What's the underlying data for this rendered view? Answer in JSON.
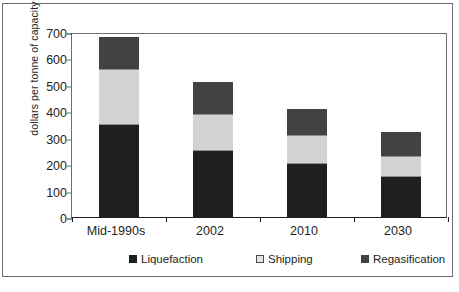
{
  "chart_data": {
    "type": "bar",
    "stacked": true,
    "title": "",
    "subtitle": "",
    "xlabel": "",
    "ylabel": "dollars per tonne of capacity",
    "categories": [
      "Mid-1990s",
      "2002",
      "2010",
      "2030"
    ],
    "series": [
      {
        "name": "Liquefaction",
        "color": "#1f1f1f",
        "values": [
          350,
          250,
          200,
          150
        ]
      },
      {
        "name": "Shipping",
        "color": "#d3d3d3",
        "values": [
          210,
          140,
          110,
          80
        ]
      },
      {
        "name": "Regasification",
        "color": "#424242",
        "values": [
          120,
          120,
          100,
          90
        ]
      }
    ],
    "totals": [
      680,
      510,
      410,
      320
    ],
    "ylim": [
      0,
      700
    ],
    "ytick_values": [
      0,
      100,
      200,
      300,
      400,
      500,
      600,
      700
    ],
    "ytick_labels": [
      "0",
      "100",
      "200",
      "300",
      "400",
      "500",
      "600",
      "700"
    ],
    "grid": false,
    "legend_position": "bottom"
  },
  "legend": {
    "items": [
      {
        "label": "Liquefaction",
        "swatch": "swatch-dark"
      },
      {
        "label": "Shipping",
        "swatch": "swatch-light"
      },
      {
        "label": "Regasification",
        "swatch": "swatch-medium"
      }
    ]
  },
  "caption": {
    "text": ""
  }
}
